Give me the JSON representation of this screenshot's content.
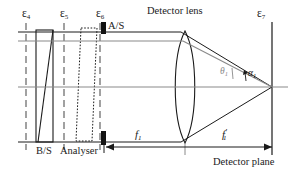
{
  "figure": {
    "kind": "optical-ray-diagram",
    "title_visible": false,
    "background_color": "#ffffff",
    "ink_color": "#1a1a1a",
    "gray_ray_color": "#8a8a8a",
    "dashed_color": "#555555"
  },
  "surface_labels": {
    "eps4": "ε",
    "eps4_sub": "4",
    "eps5": "ε",
    "eps5_sub": "5",
    "eps6": "ε",
    "eps6_sub": "6",
    "eps7": "ε",
    "eps7_sub": "7"
  },
  "component_labels": {
    "beam_splitter": "B/S",
    "analyser": "Analyser",
    "aperture_stop": "A/S",
    "detector_lens": "Detector lens",
    "detector_plane": "Detector plane"
  },
  "dimension_labels": {
    "front_focal": "f",
    "front_focal_sub": "1",
    "back_focal": "f",
    "back_focal_sub": "1",
    "back_focal_prime": "′"
  },
  "angle_labels": {
    "theta": "θ",
    "theta_sub": "1",
    "alpha": "α",
    "alpha_sub": "1"
  },
  "geometry": {
    "optical_axis_y": 87,
    "upper_marginal_y": 32,
    "lower_marginal_y": 142,
    "gray_ray_start_y": 41,
    "lens_center_x": 185,
    "lens_half_height": 56,
    "lens_edge_thickness": 2,
    "focus_x": 272,
    "detector_plane_x": 272,
    "aperture_stop_x": 104,
    "beam_splitter_x_left": 36,
    "beam_splitter_x_right": 53,
    "analyser_x_left": 80,
    "analyser_x_right": 97,
    "surface_x_eps4": 26,
    "surface_x_eps5": 64,
    "surface_x_eps6": 100
  }
}
